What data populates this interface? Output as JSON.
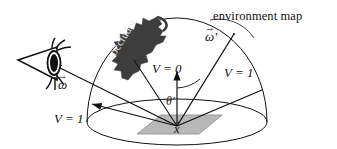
{
  "figure": {
    "background_color": "#ffffff",
    "line_color": "#111111",
    "occluder_fill": "#3d3d3d",
    "surface_patch_fill": "#b8b8b8",
    "occluder_text_color": "#e9e9e9"
  },
  "labels": {
    "environment_map": "environment map",
    "visibility_zero": "V = 0",
    "visibility_one_right": "V = 1",
    "visibility_one_left": "V = 1",
    "theta_prime": "θ'",
    "omega": "ω",
    "omega_prime": "ω'",
    "surface_point": "x",
    "occluder": "occluder",
    "vector_arrow": "→"
  },
  "diagram_data": {
    "type": "diagram",
    "hemisphere": {
      "center_x": 177,
      "center_y": 122,
      "radius_x": 90,
      "radius_y": 23,
      "dome_apex_y": 18
    },
    "surface_point": {
      "x": 177,
      "y": 126
    },
    "rays": [
      {
        "name": "view-ray-to-eye",
        "label": "ω",
        "to_x": 50,
        "to_y": 63,
        "visibility": "1"
      },
      {
        "name": "occluded-ray",
        "label": "V = 0",
        "to_x": 133,
        "to_y": 58,
        "visibility": "0"
      },
      {
        "name": "surface-normal",
        "label": "",
        "to_x": 177,
        "to_y": 70,
        "visibility": ""
      },
      {
        "name": "incident-ray-omega-prime",
        "label": "ω'",
        "to_x": 234,
        "to_y": 33,
        "visibility": "1"
      },
      {
        "name": "unoccluded-ray-right",
        "label": "V = 1",
        "to_x": 263,
        "to_y": 88,
        "visibility": "1"
      },
      {
        "name": "unoccluded-ray-left",
        "label": "V = 1",
        "to_x": 91,
        "to_y": 103,
        "visibility": "1"
      }
    ],
    "angle_arc": {
      "label": "θ'",
      "between": [
        "surface-normal",
        "incident-ray-omega-prime"
      ]
    },
    "eye": {
      "x": 45,
      "y": 63
    }
  }
}
